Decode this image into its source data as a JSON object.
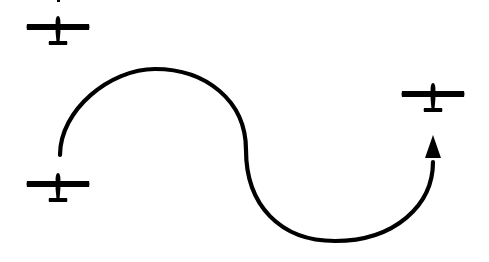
{
  "diagram": {
    "description": "Flight maneuver diagram: aircraft path curving up-right, then down, then up to a destination aircraft",
    "colors": {
      "ink": "#000000",
      "background": "#ffffff"
    },
    "aircraft": [
      {
        "id": "top-left",
        "x": 58,
        "y": 27
      },
      {
        "id": "start",
        "x": 58,
        "y": 188
      },
      {
        "id": "destination",
        "x": 433,
        "y": 98
      }
    ],
    "path": {
      "stroke_width": 4,
      "arrow": "end",
      "arrow_direction": "up"
    }
  }
}
